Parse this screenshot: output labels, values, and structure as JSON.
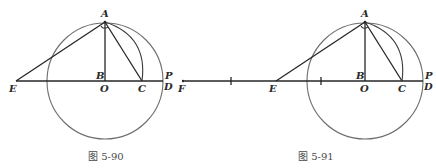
{
  "figures": [
    {
      "caption": "图 5-90",
      "labels": {
        "A": "A",
        "B": "B",
        "O": "O",
        "C": "C",
        "P": "P",
        "D": "D",
        "E": "E"
      },
      "points": {
        "A": [
          105,
          22
        ],
        "O": [
          105,
          81
        ],
        "C": [
          142,
          81
        ],
        "D": [
          163,
          81
        ],
        "E": [
          16,
          81
        ]
      },
      "circle": {
        "cx": 105,
        "cy": 81,
        "r": 58
      }
    },
    {
      "caption": "图 5-91",
      "labels": {
        "A": "A",
        "B": "B",
        "O": "O",
        "C": "C",
        "P": "P",
        "D": "D",
        "E": "E",
        "F": "F"
      },
      "points": {
        "A": [
          365,
          22
        ],
        "O": [
          365,
          81
        ],
        "C": [
          402,
          81
        ],
        "D": [
          423,
          81
        ],
        "E": [
          276,
          81
        ],
        "F": [
          183,
          81
        ]
      },
      "ticks": [
        231,
        321
      ],
      "circle": {
        "cx": 365,
        "cy": 81,
        "r": 58
      }
    }
  ],
  "colors": {
    "stroke": "#262626",
    "circle": "#6e6e6e",
    "label": "#2a2a2a"
  }
}
